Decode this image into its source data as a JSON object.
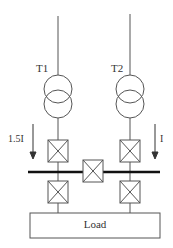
{
  "diagram": {
    "transformers": [
      {
        "label": "T1"
      },
      {
        "label": "T2"
      }
    ],
    "currents": [
      {
        "label": "1.5I"
      },
      {
        "label": "I"
      }
    ],
    "load": {
      "label": "Load"
    }
  },
  "colors": {
    "line": "#555555",
    "bus": "#111111"
  }
}
